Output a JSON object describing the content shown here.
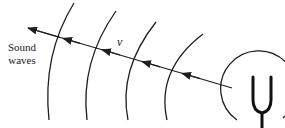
{
  "diagram": {
    "labels": {
      "sound_line1": "Sound",
      "sound_line2": "waves",
      "velocity": "v"
    },
    "elements": {
      "wavefront_count": 4,
      "source": "tuning-fork",
      "arrow_direction": "away-from-source"
    },
    "colors": {
      "stroke": "#1e1e1e",
      "background": "#ffffff"
    }
  }
}
